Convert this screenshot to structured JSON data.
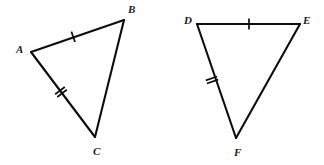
{
  "figure": {
    "background_color": "#ffffff",
    "stroke_color": "#0d0d0d",
    "label_color": "#1a1a1a",
    "width": 324,
    "height": 165
  },
  "triangles": [
    {
      "name": "triangle-abc",
      "vertices": [
        {
          "label": "A",
          "x": 31,
          "y": 52,
          "label_x": 16,
          "label_y": 44
        },
        {
          "label": "B",
          "x": 124,
          "y": 20,
          "label_x": 128,
          "label_y": 4
        },
        {
          "label": "C",
          "x": 95,
          "y": 137,
          "label_x": 93,
          "label_y": 146
        }
      ],
      "edges": [
        {
          "name": "edge-ab",
          "from": "A",
          "to": "B",
          "ticks": 1
        },
        {
          "name": "edge-bc",
          "from": "B",
          "to": "C",
          "ticks": 0
        },
        {
          "name": "edge-ac",
          "from": "A",
          "to": "C",
          "ticks": 2
        }
      ]
    },
    {
      "name": "triangle-def",
      "vertices": [
        {
          "label": "D",
          "x": 197,
          "y": 24,
          "label_x": 184,
          "label_y": 15
        },
        {
          "label": "E",
          "x": 300,
          "y": 24,
          "label_x": 303,
          "label_y": 15
        },
        {
          "label": "F",
          "x": 236,
          "y": 138,
          "label_x": 234,
          "label_y": 147
        }
      ],
      "edges": [
        {
          "name": "edge-de",
          "from": "D",
          "to": "E",
          "ticks": 1
        },
        {
          "name": "edge-ef",
          "from": "E",
          "to": "F",
          "ticks": 0
        },
        {
          "name": "edge-df",
          "from": "D",
          "to": "F",
          "ticks": 2
        }
      ]
    }
  ],
  "tick_marks": [
    {
      "name": "tick-ab-single",
      "edge": "edge-ab",
      "count": 1,
      "cx": 73.2,
      "cy": 36.8,
      "length": 11,
      "spacing": 3.2
    },
    {
      "name": "tick-ac-double",
      "edge": "edge-ac",
      "count": 2,
      "cx": 61.0,
      "cy": 92.0,
      "length": 12,
      "spacing": 3.4
    },
    {
      "name": "tick-de-single",
      "edge": "edge-de",
      "count": 1,
      "cx": 249.0,
      "cy": 24.0,
      "length": 11,
      "spacing": 3.2
    },
    {
      "name": "tick-df-double",
      "edge": "edge-df",
      "count": 2,
      "cx": 212.0,
      "cy": 80.0,
      "length": 12,
      "spacing": 3.4
    }
  ]
}
